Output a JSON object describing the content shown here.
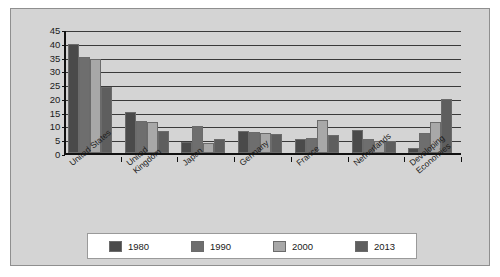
{
  "chart_data": {
    "type": "bar",
    "title": "",
    "xlabel": "",
    "ylabel": "",
    "ylim": [
      0,
      45
    ],
    "ytick_step": 5,
    "yticks": [
      "45",
      "40",
      "35",
      "30",
      "25",
      "20",
      "15",
      "10",
      "5",
      "0"
    ],
    "grid": true,
    "legend_position": "bottom",
    "categories": [
      "United States",
      "United Kingdom",
      "Japan",
      "Germany",
      "France",
      "Netherlands",
      "Developing Economies"
    ],
    "series": [
      {
        "name": "1980",
        "color": "#4a4a4a",
        "values": [
          39.5,
          15.0,
          4.0,
          8.0,
          5.0,
          8.2,
          1.7
        ]
      },
      {
        "name": "1990",
        "color": "#6e6e6e",
        "values": [
          35.0,
          11.5,
          9.8,
          7.5,
          5.5,
          5.2,
          7.2
        ]
      },
      {
        "name": "2000",
        "color": "#a8a8a8",
        "values": [
          34.2,
          11.2,
          3.7,
          7.2,
          12.0,
          4.2,
          11.2
        ]
      },
      {
        "name": "2013",
        "color": "#5e5e5e",
        "values": [
          24.0,
          8.0,
          5.0,
          6.8,
          6.7,
          4.3,
          19.5
        ]
      }
    ]
  },
  "colors": {
    "plot_background": "#d4d4d4",
    "frame_border": "#8f8f8f",
    "axis": "#111111",
    "gridline": "#3a3a3a",
    "legend_background": "#ffffff",
    "text": "#1a1a1a"
  }
}
